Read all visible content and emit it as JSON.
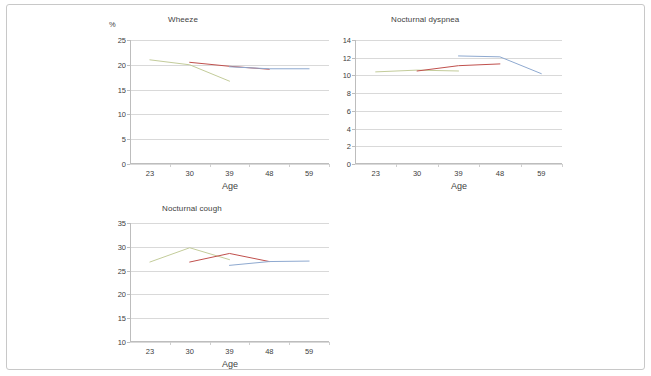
{
  "figure": {
    "axis_unit_label": "%",
    "shared_xlabel": "Age",
    "shared_categories": [
      "23",
      "30",
      "39",
      "48",
      "59"
    ],
    "series_colors": {
      "cohort_green": "#c3cc9a",
      "cohort_red": "#c0504d",
      "cohort_blue": "#8ea9d0"
    }
  },
  "chart_data": [
    {
      "type": "line",
      "title": "Wheeze",
      "xlabel": "Age",
      "ylabel": "%",
      "x": [
        23,
        30,
        39,
        48,
        59
      ],
      "xtick_labels": [
        "23",
        "30",
        "39",
        "48",
        "59"
      ],
      "ytick_labels": [
        "25",
        "20",
        "15",
        "10",
        "5",
        "0"
      ],
      "ylim": [
        0,
        25
      ],
      "ytick_step": 5,
      "grid": true,
      "legend": "none",
      "series": [
        {
          "name": "cohort_green",
          "color": "#c3cc9a",
          "x": [
            23,
            30,
            39
          ],
          "values": [
            21.0,
            20.0,
            16.7
          ]
        },
        {
          "name": "cohort_red",
          "color": "#c0504d",
          "x": [
            30,
            39,
            48
          ],
          "values": [
            20.5,
            19.7,
            19.1
          ]
        },
        {
          "name": "cohort_blue",
          "color": "#8ea9d0",
          "x": [
            39,
            48,
            59
          ],
          "values": [
            19.6,
            19.2,
            19.2
          ]
        }
      ]
    },
    {
      "type": "line",
      "title": "Nocturnal dyspnea",
      "xlabel": "Age",
      "ylabel": "",
      "x": [
        23,
        30,
        39,
        48,
        59
      ],
      "xtick_labels": [
        "23",
        "30",
        "39",
        "48",
        "59"
      ],
      "ytick_labels": [
        "14",
        "12",
        "10",
        "8",
        "6",
        "4",
        "2",
        "0"
      ],
      "ylim": [
        0,
        14
      ],
      "ytick_step": 2,
      "grid": true,
      "legend": "none",
      "series": [
        {
          "name": "cohort_green",
          "color": "#c3cc9a",
          "x": [
            23,
            30,
            39
          ],
          "values": [
            10.4,
            10.6,
            10.5
          ]
        },
        {
          "name": "cohort_red",
          "color": "#c0504d",
          "x": [
            30,
            39,
            48
          ],
          "values": [
            10.5,
            11.1,
            11.3
          ]
        },
        {
          "name": "cohort_blue",
          "color": "#8ea9d0",
          "x": [
            39,
            48,
            59
          ],
          "values": [
            12.2,
            12.1,
            10.2
          ]
        }
      ]
    },
    {
      "type": "line",
      "title": "Nocturnal cough",
      "xlabel": "Age",
      "ylabel": "",
      "x": [
        23,
        30,
        39,
        48,
        59
      ],
      "xtick_labels": [
        "23",
        "30",
        "39",
        "48",
        "59"
      ],
      "ytick_labels": [
        "35",
        "30",
        "25",
        "20",
        "15",
        "10"
      ],
      "ylim": [
        10,
        35
      ],
      "ytick_step": 5,
      "grid": true,
      "legend": "none",
      "series": [
        {
          "name": "cohort_green",
          "color": "#c3cc9a",
          "x": [
            23,
            30,
            39
          ],
          "values": [
            26.8,
            29.8,
            27.3
          ]
        },
        {
          "name": "cohort_red",
          "color": "#c0504d",
          "x": [
            30,
            39,
            48
          ],
          "values": [
            26.8,
            28.6,
            26.9
          ]
        },
        {
          "name": "cohort_blue",
          "color": "#8ea9d0",
          "x": [
            39,
            48,
            59
          ],
          "values": [
            26.1,
            26.9,
            27.0
          ]
        }
      ]
    }
  ]
}
